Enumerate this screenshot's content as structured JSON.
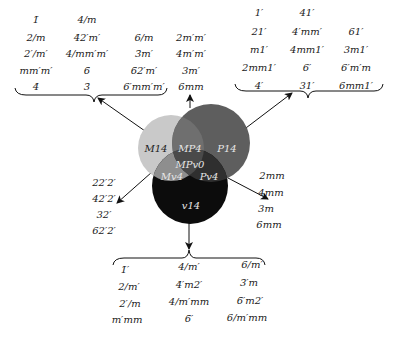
{
  "circles": {
    "m14": {
      "label": "M14",
      "color": "#c9c9c9"
    },
    "p14": {
      "label": "P14",
      "color": "#5a5a5a"
    },
    "v14": {
      "label": "v14",
      "color": "#0c0c0c"
    },
    "mp4": {
      "label": "MP4"
    },
    "mpv0": {
      "label": "MPv0"
    },
    "mv4": {
      "label": "Mv4"
    },
    "pv4": {
      "label": "Pv4"
    }
  },
  "groups": {
    "top_left": {
      "col1": [
        "1̄",
        "2/m",
        "2′/m′",
        "mm′m′",
        "4̄"
      ],
      "col2": [
        "4/m",
        "4̄2′m′",
        "4/mm′m′",
        "6̄",
        "3̄"
      ],
      "col3": [
        "6/m",
        "3̄m′",
        "6̄2′m′",
        "6′mm′m′"
      ],
      "col4": [
        "2m′m′",
        "4m′m′",
        "3m′",
        "6mm"
      ]
    },
    "top_right": {
      "col1": [
        "1′",
        "21′",
        "m1′",
        "2mm1′",
        "4′"
      ],
      "col2": [
        "41′",
        "4′mm′",
        "4mm1′",
        "6′",
        "31′"
      ],
      "col3": [
        "61′",
        "3m1′",
        "6′m′m",
        "6mm1′"
      ]
    },
    "left": [
      "22′2′",
      "42′2′",
      "32′",
      "62′2′"
    ],
    "right": [
      "2mm",
      "4mm",
      "3m",
      "6mm"
    ],
    "bottom": {
      "col1": [
        "1̄′",
        "2/m′",
        "2′/m",
        "m′mm"
      ],
      "col2": [
        "4/m′",
        "4̄′m2′",
        "4/m′mm",
        "6̄′"
      ],
      "col3": [
        "6/m′",
        "3̄′m",
        "6̄′m2′",
        "6/m′mm"
      ]
    }
  }
}
